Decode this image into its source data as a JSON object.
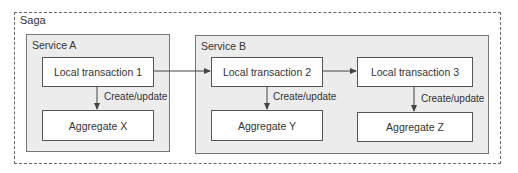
{
  "saga": {
    "label": "Saga"
  },
  "services": [
    {
      "label": "Service A"
    },
    {
      "label": "Service B"
    }
  ],
  "transactions": [
    {
      "label": "Local transaction 1"
    },
    {
      "label": "Local transaction 2"
    },
    {
      "label": "Local transaction 3"
    }
  ],
  "aggregates": [
    {
      "label": "Aggregate X"
    },
    {
      "label": "Aggregate Y"
    },
    {
      "label": "Aggregate Z"
    }
  ],
  "edge_labels": {
    "create_update": "Create/update"
  },
  "colors": {
    "service_fill": "#ececec",
    "box_fill": "#ffffff",
    "border": "#555555"
  }
}
